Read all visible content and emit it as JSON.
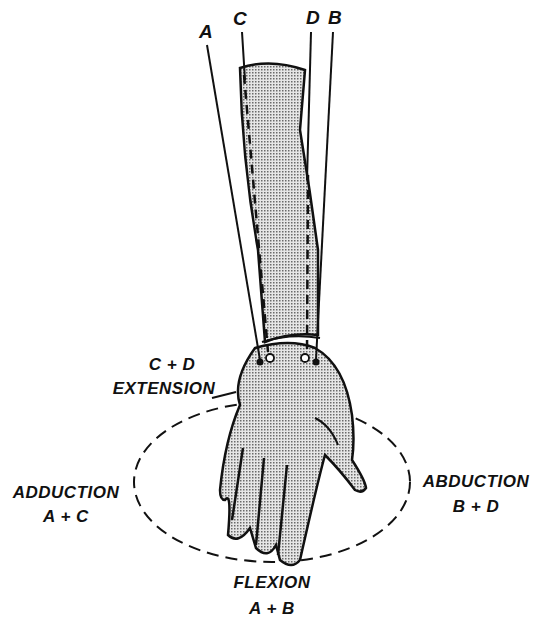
{
  "diagram": {
    "wire_labels": {
      "A": "A",
      "B": "B",
      "C": "C",
      "D": "D"
    },
    "movements": {
      "extension": {
        "combo": "C + D",
        "name": "EXTENSION"
      },
      "flexion": {
        "name": "FLEXION",
        "combo": "A + B"
      },
      "adduction": {
        "name": "ADDUCTION",
        "combo": "A + C"
      },
      "abduction": {
        "name": "ABDUCTION",
        "combo": "B + D"
      }
    },
    "colors": {
      "ink": "#111111",
      "fill_stipple": "#bdbdbd",
      "background": "#ffffff"
    }
  }
}
